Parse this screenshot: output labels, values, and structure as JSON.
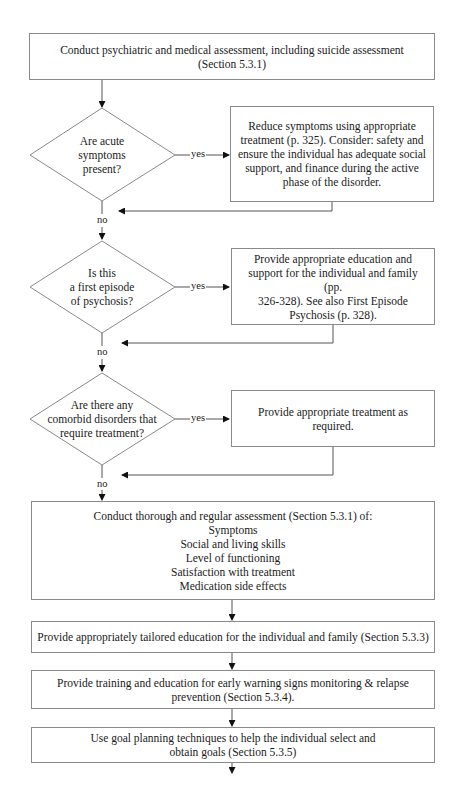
{
  "flowchart": {
    "start": {
      "lines": [
        "Conduct psychiatric and medical assessment, including suicide assessment",
        "(Section 5.3.1)"
      ]
    },
    "decisions": [
      {
        "question_lines": [
          "Are acute",
          "symptoms",
          "present?"
        ],
        "yes_label": "yes",
        "no_label": "no",
        "action_lines": [
          "Reduce symptoms using appropriate",
          "treatment (p. 325). Consider: safety and",
          "ensure the individual has adequate social",
          "support, and finance during the active",
          "phase of the disorder."
        ]
      },
      {
        "question_lines": [
          "Is this",
          "a first episode",
          "of psychosis?"
        ],
        "yes_label": "yes",
        "no_label": "no",
        "action_lines": [
          "Provide appropriate education and",
          "support for the individual and family (pp.",
          "326-328). See also First Episode",
          "Psychosis (p. 328)."
        ]
      },
      {
        "question_lines": [
          "Are there any",
          "comorbid disorders that",
          "require treatment?"
        ],
        "yes_label": "yes",
        "no_label": "no",
        "action_lines": [
          "Provide appropriate treatment as",
          "required."
        ]
      }
    ],
    "assessment": {
      "lines": [
        "Conduct thorough and regular assessment (Section 5.3.1) of:",
        "Symptoms",
        "Social and living skills",
        "Level of functioning",
        "Satisfaction with treatment",
        "Medication side effects"
      ]
    },
    "steps": [
      {
        "lines": [
          "Provide appropriately tailored education for the individual and family (Section 5.3.3)"
        ]
      },
      {
        "lines": [
          "Provide training and education for early warning signs monitoring & relapse",
          "prevention (Section 5.3.4)."
        ]
      },
      {
        "lines": [
          "Use goal planning techniques to help the individual select and",
          "obtain goals (Section 5.3.5)"
        ]
      }
    ],
    "colors": {
      "line": "#555555",
      "border": "#8a8a8a",
      "text": "#1a1a1a",
      "arrowhead": "#111111"
    }
  }
}
